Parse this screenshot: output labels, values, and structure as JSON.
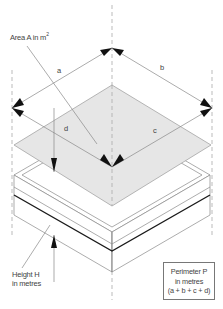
{
  "diagram": {
    "type": "isometric roof/slab dimension diagram",
    "labels": {
      "area": "Area A in m",
      "area_sup": "2",
      "side_a": "a",
      "side_b": "b",
      "side_c": "c",
      "side_d": "d",
      "height_line1": "Height H",
      "height_line2": "in metres",
      "perimeter_line1": "Perimeter P",
      "perimeter_line2": "in metres",
      "perimeter_line3": "(a + b + c + d)"
    },
    "colors": {
      "area_fill": "#e6e6e6",
      "line": "#888888",
      "arrow": "#111111",
      "bold_edge": "#1a1a1a"
    }
  }
}
